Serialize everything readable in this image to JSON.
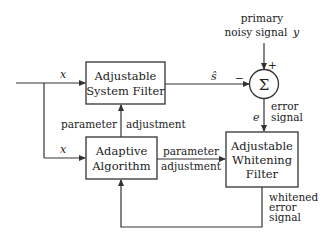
{
  "diagram": {
    "blocks": {
      "system_filter": {
        "line1": "Adjustable",
        "line2": "System Filter"
      },
      "adaptive_algorithm": {
        "line1": "Adaptive",
        "line2": "Algorithm"
      },
      "whitening_filter": {
        "line1": "Adjustable",
        "line2": "Whitening",
        "line3": "Filter"
      },
      "summer": {
        "symbol": "Σ",
        "plus": "+",
        "minus": "−"
      }
    },
    "labels": {
      "input_x_top": "x",
      "input_x_bottom": "x",
      "primary_line1": "primary",
      "primary_line2": "noisy signal",
      "primary_var": "y",
      "s_hat": "ŝ",
      "error_var": "e",
      "error_line1": "error",
      "error_line2": "signal",
      "param_adj_vertical_left": "parameter",
      "param_adj_vertical_right": "adjustment",
      "param_adj_horizontal_top": "parameter",
      "param_adj_horizontal_bottom": "adjustment",
      "whitened_line1": "whitened",
      "whitened_line2": "error",
      "whitened_line3": "signal"
    }
  }
}
